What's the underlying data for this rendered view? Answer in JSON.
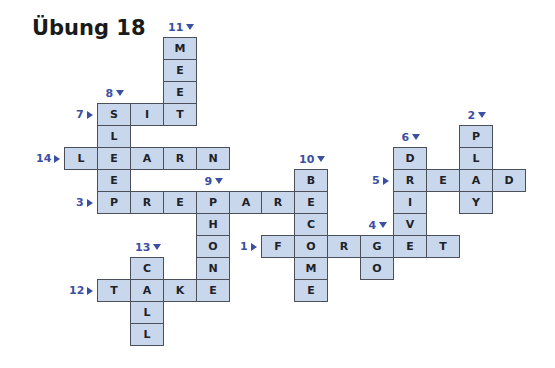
{
  "title": "Übung 18",
  "colors": {
    "cell_fill": "#c9d7ec",
    "cell_border": "#4a4f5a",
    "clue_number": "#3b4fa3",
    "letter": "#1e2228"
  },
  "grid": {
    "origin_x": 64,
    "origin_y": 37,
    "cell_w": 32.9,
    "cell_h": 22
  },
  "words": [
    {
      "number": "1",
      "direction": "across",
      "word": "FORGET",
      "row": 9,
      "col": 6
    },
    {
      "number": "2",
      "direction": "down",
      "word": "PLAY",
      "row": 4,
      "col": 12
    },
    {
      "number": "3",
      "direction": "across",
      "word": "PREPARE",
      "row": 7,
      "col": 1
    },
    {
      "number": "4",
      "direction": "down",
      "word": "GO",
      "row": 9,
      "col": 9
    },
    {
      "number": "5",
      "direction": "across",
      "word": "READ",
      "row": 6,
      "col": 10
    },
    {
      "number": "6",
      "direction": "down",
      "word": "DRIVE",
      "row": 5,
      "col": 10
    },
    {
      "number": "7",
      "direction": "across",
      "word": "SIT",
      "row": 3,
      "col": 1
    },
    {
      "number": "8",
      "direction": "down",
      "word": "SLEEP",
      "row": 3,
      "col": 1
    },
    {
      "number": "9",
      "direction": "down",
      "word": "PHONE",
      "row": 7,
      "col": 4
    },
    {
      "number": "10",
      "direction": "down",
      "word": "BECOME",
      "row": 6,
      "col": 7
    },
    {
      "number": "11",
      "direction": "down",
      "word": "MEET",
      "row": 0,
      "col": 3
    },
    {
      "number": "12",
      "direction": "across",
      "word": "TAKE",
      "row": 11,
      "col": 1
    },
    {
      "number": "13",
      "direction": "down",
      "word": "CALL",
      "row": 10,
      "col": 2
    },
    {
      "number": "14",
      "direction": "across",
      "word": "LEARN",
      "row": 5,
      "col": 0
    }
  ]
}
